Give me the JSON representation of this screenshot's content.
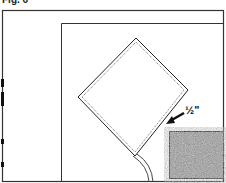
{
  "figure": {
    "label": "Fig. 6",
    "measurement_label": "½\"",
    "colors": {
      "line": "#222222",
      "swatch": "#8a8a8a"
    }
  }
}
